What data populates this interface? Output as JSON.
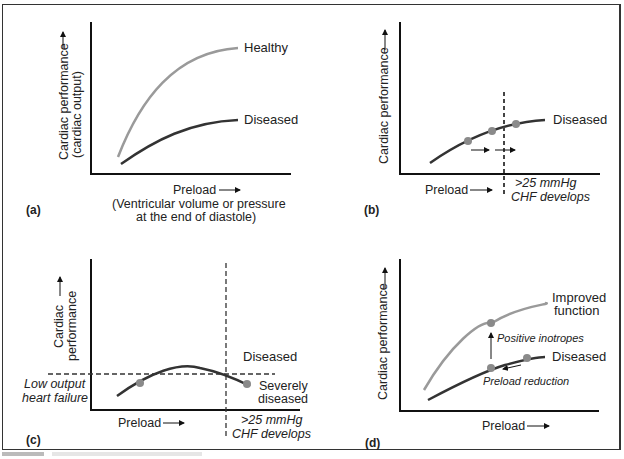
{
  "panels": {
    "a": {
      "label": "(a)",
      "y_axis_line1": "Cardiac performance",
      "y_axis_line2": "(cardiac output)",
      "x_axis_line1": "Preload",
      "x_axis_line2": "(Ventricular volume or pressure",
      "x_axis_line3": "at the end of diastole)",
      "curve_healthy": "Healthy",
      "curve_diseased": "Diseased"
    },
    "b": {
      "label": "(b)",
      "y_axis": "Cardiac performance",
      "x_axis": "Preload",
      "curve": "Diseased",
      "threshold_line1": ">25 mmHg",
      "threshold_line2": "CHF develops"
    },
    "c": {
      "label": "(c)",
      "y_axis_line1": "Cardiac",
      "y_axis_line2": "performance",
      "x_axis": "Preload",
      "region_diseased": "Diseased",
      "low_output_line1": "Low output",
      "low_output_line2": "heart failure",
      "severe_line1": "Severely",
      "severe_line2": "diseased",
      "threshold_line1": ">25 mmHg",
      "threshold_line2": "CHF develops"
    },
    "d": {
      "label": "(d)",
      "y_axis": "Cardiac performance",
      "x_axis": "Preload",
      "curve_improved_line1": "Improved",
      "curve_improved_line2": "function",
      "curve_diseased": "Diseased",
      "annotation_inotropes": "Positive inotropes",
      "annotation_preload": "Preload reduction"
    }
  },
  "colors": {
    "healthy_curve": "#9a9a9a",
    "diseased_curve": "#333333",
    "marker": "#8a8a8a",
    "axis": "#111111"
  }
}
